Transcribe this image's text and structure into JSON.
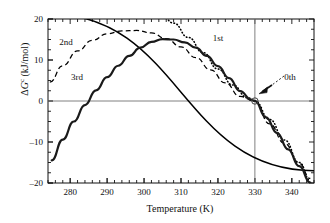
{
  "chart_data": {
    "type": "line",
    "title": "",
    "xlabel": "Temperature (K)",
    "ylabel_parts": {
      "delta": "Δ",
      "symbol": "G",
      "superscript": "c",
      "units": " (kJ/mol)"
    },
    "ylabel": "ΔGᶜ (kJ/mol)",
    "xlim": [
      274,
      346
    ],
    "ylim": [
      -20,
      20
    ],
    "xticks": [
      280,
      290,
      300,
      310,
      320,
      330,
      340
    ],
    "xtick_labels": [
      "280",
      "290",
      "300",
      "310",
      "320",
      "330",
      "340"
    ],
    "yticks": [
      -20,
      -10,
      0,
      10,
      20
    ],
    "ytick_labels": [
      "-20",
      "-10",
      "0",
      "10",
      "20"
    ],
    "x_minor_interval": 2,
    "y_minor_interval": 2.5,
    "grid": false,
    "legend": "inline-annotations",
    "reference_lines": [
      {
        "name": "zero-line",
        "orientation": "horizontal",
        "value": 0,
        "color": "#808080"
      },
      {
        "name": "equilibrium-temperature-line",
        "orientation": "vertical",
        "value": 330,
        "color": "#808080"
      }
    ],
    "marker": {
      "name": "crossing-point",
      "x": 330,
      "y": 0,
      "style": "open-circle"
    },
    "series": [
      {
        "name": "0th",
        "label": "0th",
        "style": "solid-straight",
        "color": "#000000",
        "description": "zeroth-order linear approximation crossing zero at 330 K",
        "x": [
          274,
          346
        ],
        "y": [
          21.3,
          -17.0
        ]
      },
      {
        "name": "1st",
        "label": "1st",
        "style": "dotted",
        "color": "#000000",
        "x": [
          296,
          300,
          304,
          308,
          312,
          316,
          320,
          324,
          328,
          330,
          334,
          338,
          342,
          345
        ],
        "y": [
          28.0,
          25.2,
          22.2,
          19.0,
          15.5,
          11.8,
          7.8,
          3.9,
          0.8,
          0.0,
          -4.5,
          -9.5,
          -15.0,
          -19.4
        ]
      },
      {
        "name": "2nd",
        "label": "2nd",
        "style": "dashed",
        "color": "#000000",
        "x": [
          274.5,
          278,
          282,
          286,
          290,
          294,
          298,
          302,
          306,
          310,
          314,
          318,
          322,
          326,
          330,
          334,
          338,
          342,
          345
        ],
        "y": [
          4.6,
          8.6,
          12.2,
          14.8,
          16.4,
          17.1,
          17.2,
          16.6,
          15.2,
          13.2,
          10.6,
          7.6,
          4.4,
          1.1,
          0.0,
          -5.6,
          -10.3,
          -15.2,
          -18.9
        ]
      },
      {
        "name": "3rd",
        "label": "3rd",
        "style": "solid-thick",
        "color": "#1a1a1a",
        "x": [
          275,
          278,
          281,
          284,
          287,
          290,
          293,
          296,
          299,
          302,
          305,
          308,
          311,
          314,
          317,
          320,
          323,
          326,
          329,
          330,
          333,
          336,
          339,
          342,
          345
        ],
        "y": [
          -14.5,
          -9.4,
          -5.0,
          -1.0,
          2.6,
          5.8,
          8.6,
          11.0,
          13.0,
          14.4,
          15.1,
          15.0,
          14.3,
          13.0,
          11.0,
          8.5,
          5.6,
          2.4,
          0.35,
          0.0,
          -4.0,
          -7.8,
          -11.8,
          -15.9,
          -19.9
        ]
      }
    ],
    "annotations": [
      {
        "name": "label-2nd",
        "text": "2nd",
        "x_px": 66,
        "y_px": 45
      },
      {
        "name": "label-3rd",
        "text": "3rd",
        "x_px": 77,
        "y_px": 80
      },
      {
        "name": "label-1st",
        "text": "1st",
        "x_px": 218,
        "y_px": 41
      },
      {
        "name": "label-0th",
        "text": "0th",
        "x_px": 290,
        "y_px": 80
      }
    ]
  },
  "figure": {
    "xlabel": "Temperature (K)",
    "ylabel_delta": "Δ",
    "ylabel_symbol": "G",
    "ylabel_sup": "c",
    "ylabel_units": " (kJ/mol)"
  }
}
